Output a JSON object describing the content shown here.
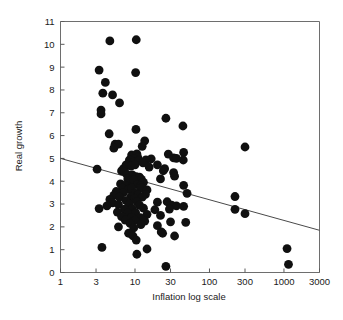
{
  "chart_data": {
    "type": "scatter",
    "title": "",
    "xlabel": "Inflation log scale",
    "ylabel": "Real growth",
    "xscale": "log",
    "yscale": "linear",
    "xlim": [
      1,
      3000
    ],
    "ylim": [
      0,
      11
    ],
    "grid": false,
    "legend": null,
    "xticks": [
      1,
      3,
      10,
      30,
      100,
      300,
      1000,
      3000
    ],
    "xtick_labels": [
      "1",
      "3",
      "10",
      "30",
      "100",
      "300",
      "1000",
      "3000"
    ],
    "yticks": [
      0,
      1,
      2,
      3,
      4,
      5,
      6,
      7,
      8,
      9,
      10,
      11
    ],
    "ytick_labels": [
      "0",
      "1",
      "2",
      "3",
      "4",
      "5",
      "6",
      "7",
      "8",
      "9",
      "10",
      "11"
    ],
    "marker": {
      "shape": "circle",
      "color": "#101010",
      "size": 4.4
    },
    "trendline": {
      "type": "linear-in-log-x",
      "color": "#4a4a4a",
      "x_start": 1,
      "y_start": 5.0,
      "x_end": 3000,
      "y_end": 1.85,
      "description": "Downward sloping fitted regression line"
    },
    "points": [
      [
        4.6,
        10.15
      ],
      [
        10.4,
        10.2
      ],
      [
        3.3,
        8.87
      ],
      [
        10.2,
        8.76
      ],
      [
        4.0,
        8.33
      ],
      [
        3.7,
        7.86
      ],
      [
        5.0,
        7.78
      ],
      [
        6.2,
        7.43
      ],
      [
        3.5,
        7.12
      ],
      [
        3.5,
        6.95
      ],
      [
        26.0,
        6.76
      ],
      [
        44.0,
        6.42
      ],
      [
        10.3,
        6.27
      ],
      [
        4.5,
        6.08
      ],
      [
        5.4,
        5.62
      ],
      [
        6.0,
        5.63
      ],
      [
        5.2,
        5.45
      ],
      [
        13.5,
        5.77
      ],
      [
        12.5,
        5.53
      ],
      [
        300.0,
        5.5
      ],
      [
        45.0,
        5.26
      ],
      [
        28.0,
        5.19
      ],
      [
        9.0,
        5.15
      ],
      [
        10.6,
        5.2
      ],
      [
        10.9,
        5.05
      ],
      [
        9.5,
        5.0
      ],
      [
        44.5,
        4.93
      ],
      [
        33.0,
        5.02
      ],
      [
        36.0,
        5.0
      ],
      [
        16.5,
        4.98
      ],
      [
        8.4,
        4.93
      ],
      [
        9.8,
        4.87
      ],
      [
        11.2,
        4.9
      ],
      [
        14.0,
        4.94
      ],
      [
        7.6,
        4.72
      ],
      [
        8.8,
        4.66
      ],
      [
        10.0,
        4.72
      ],
      [
        12.8,
        4.8
      ],
      [
        20.0,
        4.72
      ],
      [
        15.5,
        4.62
      ],
      [
        24.0,
        4.46
      ],
      [
        25.0,
        4.55
      ],
      [
        33.0,
        4.38
      ],
      [
        34.0,
        4.22
      ],
      [
        7.0,
        4.55
      ],
      [
        3.1,
        4.53
      ],
      [
        6.6,
        4.45
      ],
      [
        7.2,
        4.42
      ],
      [
        7.8,
        4.3
      ],
      [
        9.2,
        4.28
      ],
      [
        10.4,
        4.2
      ],
      [
        11.5,
        4.18
      ],
      [
        12.2,
        4.08
      ],
      [
        22.0,
        4.1
      ],
      [
        8.0,
        4.1
      ],
      [
        8.6,
        4.0
      ],
      [
        9.6,
        4.05
      ],
      [
        13.0,
        3.95
      ],
      [
        6.4,
        3.88
      ],
      [
        7.4,
        3.82
      ],
      [
        10.8,
        3.85
      ],
      [
        11.8,
        3.78
      ],
      [
        45.0,
        3.82
      ],
      [
        6.8,
        3.7
      ],
      [
        8.2,
        3.65
      ],
      [
        9.0,
        3.7
      ],
      [
        12.0,
        3.7
      ],
      [
        14.5,
        3.62
      ],
      [
        5.6,
        3.55
      ],
      [
        7.0,
        3.5
      ],
      [
        10.0,
        3.48
      ],
      [
        11.0,
        3.4
      ],
      [
        13.8,
        3.42
      ],
      [
        5.2,
        3.38
      ],
      [
        6.2,
        3.3
      ],
      [
        8.8,
        3.32
      ],
      [
        9.8,
        3.25
      ],
      [
        12.5,
        3.3
      ],
      [
        220.0,
        3.33
      ],
      [
        50.0,
        3.47
      ],
      [
        4.6,
        3.2
      ],
      [
        7.6,
        3.15
      ],
      [
        10.6,
        3.12
      ],
      [
        20.0,
        3.08
      ],
      [
        27.0,
        3.1
      ],
      [
        5.0,
        3.05
      ],
      [
        6.0,
        2.98
      ],
      [
        8.4,
        3.0
      ],
      [
        11.5,
        2.95
      ],
      [
        31.0,
        2.95
      ],
      [
        36.0,
        2.92
      ],
      [
        45.0,
        2.9
      ],
      [
        4.2,
        2.92
      ],
      [
        3.3,
        2.8
      ],
      [
        7.2,
        2.78
      ],
      [
        9.2,
        2.8
      ],
      [
        13.0,
        2.82
      ],
      [
        18.5,
        2.75
      ],
      [
        29.0,
        2.78
      ],
      [
        220.0,
        2.77
      ],
      [
        300.0,
        2.58
      ],
      [
        5.8,
        2.65
      ],
      [
        8.0,
        2.6
      ],
      [
        10.2,
        2.62
      ],
      [
        14.5,
        2.55
      ],
      [
        22.0,
        2.5
      ],
      [
        6.6,
        2.45
      ],
      [
        9.0,
        2.42
      ],
      [
        11.8,
        2.4
      ],
      [
        7.4,
        2.3
      ],
      [
        10.0,
        2.28
      ],
      [
        13.5,
        2.25
      ],
      [
        30.0,
        2.22
      ],
      [
        48.0,
        2.2
      ],
      [
        8.6,
        2.15
      ],
      [
        12.0,
        2.1
      ],
      [
        20.0,
        2.05
      ],
      [
        6.0,
        2.0
      ],
      [
        9.6,
        1.95
      ],
      [
        22.5,
        1.78
      ],
      [
        23.5,
        1.72
      ],
      [
        8.2,
        1.72
      ],
      [
        9.4,
        1.6
      ],
      [
        34.0,
        1.6
      ],
      [
        10.4,
        1.42
      ],
      [
        3.6,
        1.1
      ],
      [
        14.5,
        1.03
      ],
      [
        1100.0,
        1.05
      ],
      [
        10.6,
        0.8
      ],
      [
        26.0,
        0.27
      ],
      [
        1150.0,
        0.36
      ]
    ]
  },
  "axes": {
    "x_axis_label": "Inflation log scale",
    "y_axis_label": "Real growth"
  }
}
